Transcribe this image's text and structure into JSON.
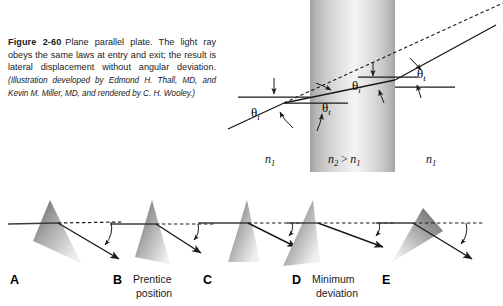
{
  "caption": {
    "figure_number": "Figure 2-60",
    "title_text": "Plane parallel plate. The light ray obeys the same laws at entry and exit; the result is lateral displacement without angular deviation.",
    "credit": "(Illustration developed by Edmond H. Thall, MD, and Kevin M. Miller, MD, and rendered by C. H. Wooley.)"
  },
  "plate_figure": {
    "name": "plane-parallel-plate-diagram",
    "media_labels": {
      "left": "n",
      "left_sub": "1",
      "middle_a": "n",
      "middle_a_sub": "2",
      "middle_op": ">",
      "middle_b": "n",
      "middle_b_sub": "1",
      "right": "n",
      "right_sub": "1"
    },
    "angles": [
      {
        "id": "theta-i-entry",
        "symbol": "θ",
        "sub": "i"
      },
      {
        "id": "theta-t-entry",
        "symbol": "θ",
        "sub": "t"
      },
      {
        "id": "theta-i-exit",
        "symbol": "θ",
        "sub": "i"
      },
      {
        "id": "theta-t-exit",
        "symbol": "θ",
        "sub": "t"
      }
    ],
    "colors": {
      "ray": "#1a1a1a",
      "normal": "#1a1a1a",
      "plate_edge": "#9a9a9a",
      "plate_light": "#f2f2f2"
    }
  },
  "prism_row": {
    "panels": [
      {
        "letter": "A",
        "caption": ""
      },
      {
        "letter": "B",
        "caption_line1": "Prentice",
        "caption_line2": "position"
      },
      {
        "letter": "C",
        "caption": ""
      },
      {
        "letter": "D",
        "caption_line1": "Minimum",
        "caption_line2": "deviation"
      },
      {
        "letter": "E",
        "caption": ""
      }
    ]
  }
}
